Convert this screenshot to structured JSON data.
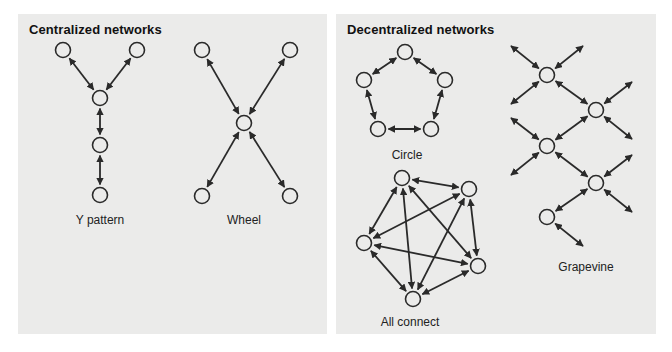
{
  "panels": {
    "centralized": {
      "title": "Centralized networks",
      "diagrams": [
        {
          "name": "Y pattern",
          "label": "Y pattern",
          "nodes": [
            [
              63,
              50
            ],
            [
              137,
              50
            ],
            [
              100,
              98
            ],
            [
              100,
              145
            ],
            [
              100,
              195
            ]
          ],
          "edges": [
            [
              0,
              2
            ],
            [
              1,
              2
            ],
            [
              2,
              3
            ],
            [
              3,
              4
            ]
          ]
        },
        {
          "name": "Wheel",
          "label": "Wheel",
          "nodes": [
            [
              202,
              50
            ],
            [
              290,
              50
            ],
            [
              244,
              123
            ],
            [
              202,
              196
            ],
            [
              290,
              196
            ]
          ],
          "edges": [
            [
              0,
              2
            ],
            [
              1,
              2
            ],
            [
              3,
              2
            ],
            [
              4,
              2
            ]
          ]
        }
      ]
    },
    "decentralized": {
      "title": "Decentralized networks",
      "diagrams": [
        {
          "name": "Circle",
          "label": "Circle",
          "nodes": [
            [
              405,
              52
            ],
            [
              364,
              80
            ],
            [
              445,
              80
            ],
            [
              378,
              129
            ],
            [
              431,
              129
            ]
          ],
          "edges": [
            [
              0,
              1
            ],
            [
              0,
              2
            ],
            [
              1,
              3
            ],
            [
              2,
              4
            ],
            [
              3,
              4
            ]
          ]
        },
        {
          "name": "All connect",
          "label": "All connect",
          "nodes": [
            [
              402,
              178
            ],
            [
              469,
              189
            ],
            [
              364,
              243
            ],
            [
              478,
              266
            ],
            [
              413,
              299
            ]
          ],
          "edges": [
            [
              0,
              1
            ],
            [
              0,
              2
            ],
            [
              0,
              3
            ],
            [
              0,
              4
            ],
            [
              1,
              2
            ],
            [
              1,
              3
            ],
            [
              1,
              4
            ],
            [
              2,
              3
            ],
            [
              2,
              4
            ],
            [
              3,
              4
            ]
          ]
        },
        {
          "name": "Grapevine",
          "label": "Grapevine",
          "nodes": [
            [
              547,
              75
            ],
            [
              596,
              110
            ],
            [
              547,
              146
            ],
            [
              596,
              183
            ],
            [
              547,
              217
            ]
          ],
          "edges": [
            [
              0,
              1
            ],
            [
              1,
              2
            ],
            [
              2,
              3
            ],
            [
              3,
              4
            ]
          ],
          "loose_arrows": [
            [
              547,
              75,
              511,
              46
            ],
            [
              547,
              75,
              583,
              46
            ],
            [
              547,
              75,
              511,
              104
            ],
            [
              596,
              110,
              632,
              82
            ],
            [
              596,
              110,
              632,
              139
            ],
            [
              547,
              146,
              511,
              118
            ],
            [
              547,
              146,
              511,
              175
            ],
            [
              596,
              183,
              632,
              155
            ],
            [
              596,
              183,
              632,
              212
            ],
            [
              547,
              217,
              583,
              246
            ]
          ]
        }
      ]
    }
  },
  "colors": {
    "background": "#ffffff",
    "panel": "#ebebea",
    "stroke": "#2a2a2a"
  }
}
